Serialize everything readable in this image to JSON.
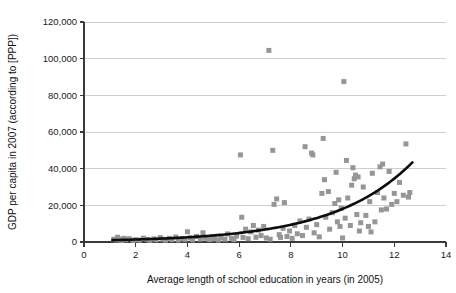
{
  "chart_data": {
    "type": "scatter",
    "title": "",
    "xlabel": "Average length of school education in years (in 2005)",
    "ylabel": "GDP per capita in 2007 (according to [PPP])",
    "xlim": [
      0,
      14
    ],
    "ylim": [
      0,
      120000
    ],
    "xticks": [
      0,
      2,
      4,
      6,
      8,
      10,
      12,
      14
    ],
    "xtick_labels": [
      "0",
      "2",
      "4",
      "6",
      "8",
      "10",
      "12",
      "14"
    ],
    "yticks": [
      0,
      20000,
      40000,
      60000,
      80000,
      100000,
      120000
    ],
    "ytick_labels": [
      "0",
      "20,000",
      "40,000",
      "60,000",
      "80,000",
      "100,000",
      "120,000"
    ],
    "grid": "horizontal",
    "legend": "none",
    "marker_color": "#969696",
    "marker_shape": "square",
    "marker_size": 5,
    "trendline_color": "#0d0d0d",
    "trendline_note": "exponential fit rising from ~1,000 at x=1.1 to ~43,000 at x=12.7",
    "series": [
      {
        "name": "Countries",
        "points": [
          [
            1.15,
            1500
          ],
          [
            1.25,
            1100
          ],
          [
            1.3,
            2600
          ],
          [
            1.4,
            1600
          ],
          [
            1.45,
            900
          ],
          [
            1.55,
            2000
          ],
          [
            1.6,
            1200
          ],
          [
            1.75,
            1800
          ],
          [
            1.9,
            900
          ],
          [
            2.0,
            1300
          ],
          [
            2.15,
            1000
          ],
          [
            2.3,
            2100
          ],
          [
            2.45,
            1400
          ],
          [
            2.55,
            900
          ],
          [
            2.7,
            1700
          ],
          [
            2.8,
            1200
          ],
          [
            2.95,
            2400
          ],
          [
            3.05,
            1500
          ],
          [
            3.15,
            1000
          ],
          [
            3.3,
            2000
          ],
          [
            3.4,
            1300
          ],
          [
            3.55,
            2700
          ],
          [
            3.65,
            1100
          ],
          [
            3.8,
            1900
          ],
          [
            3.9,
            1400
          ],
          [
            4.0,
            5600
          ],
          [
            4.1,
            2200
          ],
          [
            4.2,
            1200
          ],
          [
            4.35,
            3000
          ],
          [
            4.5,
            1600
          ],
          [
            4.6,
            5000
          ],
          [
            4.7,
            2000
          ],
          [
            4.85,
            1300
          ],
          [
            4.95,
            2800
          ],
          [
            5.05,
            1700
          ],
          [
            5.2,
            1100
          ],
          [
            5.3,
            2300
          ],
          [
            5.45,
            1500
          ],
          [
            5.55,
            4400
          ],
          [
            5.7,
            2000
          ],
          [
            5.8,
            1300
          ],
          [
            5.9,
            3200
          ],
          [
            6.05,
            47500
          ],
          [
            6.1,
            13500
          ],
          [
            6.15,
            2500
          ],
          [
            6.25,
            7000
          ],
          [
            6.35,
            1800
          ],
          [
            6.45,
            5500
          ],
          [
            6.55,
            9000
          ],
          [
            6.65,
            2600
          ],
          [
            6.75,
            6500
          ],
          [
            6.85,
            3500
          ],
          [
            6.95,
            8500
          ],
          [
            7.05,
            2200
          ],
          [
            7.15,
            104500
          ],
          [
            7.2,
            1500
          ],
          [
            7.3,
            50000
          ],
          [
            7.35,
            20500
          ],
          [
            7.45,
            23500
          ],
          [
            7.55,
            4000
          ],
          [
            7.6,
            2500
          ],
          [
            7.7,
            7500
          ],
          [
            7.75,
            21500
          ],
          [
            7.85,
            3000
          ],
          [
            7.95,
            6000
          ],
          [
            8.05,
            2000
          ],
          [
            8.15,
            9000
          ],
          [
            8.25,
            4500
          ],
          [
            8.35,
            11500
          ],
          [
            8.45,
            3500
          ],
          [
            8.55,
            52000
          ],
          [
            8.6,
            8000
          ],
          [
            8.7,
            12500
          ],
          [
            8.8,
            48500
          ],
          [
            8.85,
            47500
          ],
          [
            8.9,
            5000
          ],
          [
            9.0,
            9500
          ],
          [
            9.1,
            2800
          ],
          [
            9.2,
            26500
          ],
          [
            9.25,
            56500
          ],
          [
            9.3,
            34000
          ],
          [
            9.35,
            13500
          ],
          [
            9.45,
            27500
          ],
          [
            9.5,
            7000
          ],
          [
            9.6,
            16000
          ],
          [
            9.7,
            21000
          ],
          [
            9.75,
            38000
          ],
          [
            9.8,
            11000
          ],
          [
            9.85,
            23000
          ],
          [
            9.9,
            8500
          ],
          [
            9.95,
            18500
          ],
          [
            10.0,
            2200
          ],
          [
            10.05,
            87500
          ],
          [
            10.1,
            13000
          ],
          [
            10.15,
            44500
          ],
          [
            10.2,
            24000
          ],
          [
            10.3,
            9000
          ],
          [
            10.35,
            31000
          ],
          [
            10.4,
            40500
          ],
          [
            10.45,
            34500
          ],
          [
            10.5,
            36500
          ],
          [
            10.55,
            15000
          ],
          [
            10.6,
            35500
          ],
          [
            10.65,
            6000
          ],
          [
            10.7,
            10500
          ],
          [
            10.8,
            30000
          ],
          [
            10.9,
            14500
          ],
          [
            11.0,
            8500
          ],
          [
            11.05,
            22000
          ],
          [
            11.1,
            5500
          ],
          [
            11.15,
            37500
          ],
          [
            11.25,
            11000
          ],
          [
            11.35,
            27000
          ],
          [
            11.45,
            41000
          ],
          [
            11.5,
            17500
          ],
          [
            11.55,
            42500
          ],
          [
            11.6,
            24000
          ],
          [
            11.7,
            18000
          ],
          [
            11.8,
            38500
          ],
          [
            11.9,
            20500
          ],
          [
            12.0,
            26500
          ],
          [
            12.1,
            22000
          ],
          [
            12.2,
            32500
          ],
          [
            12.35,
            25500
          ],
          [
            12.45,
            53500
          ],
          [
            12.55,
            24500
          ],
          [
            12.6,
            27000
          ]
        ]
      }
    ]
  },
  "axes": {
    "x_title": "Average length of school education in years (in 2005)",
    "y_title": "GDP per capita in 2007 (according to [PPP])"
  }
}
